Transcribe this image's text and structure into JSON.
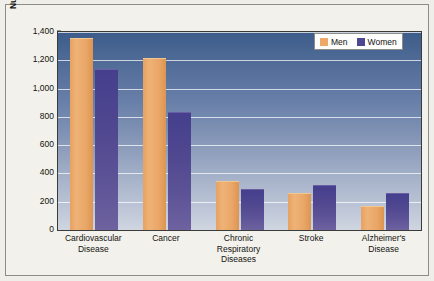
{
  "chart_data": {
    "type": "bar",
    "title": "",
    "xlabel": "",
    "ylabel": "Number of Deaths per 100,000 Annually",
    "ylim": [
      0,
      1400
    ],
    "yticks": [
      "0",
      "200",
      "400",
      "600",
      "800",
      "1,000",
      "1,200",
      "1,400"
    ],
    "ytick_values": [
      0,
      200,
      400,
      600,
      800,
      1000,
      1200,
      1400
    ],
    "grid": true,
    "legend_position": "top-right",
    "categories": [
      "Cardiovascular Disease",
      "Cancer",
      "Chronic Respiratory Diseases",
      "Stroke",
      "Alzheimer's Disease"
    ],
    "category_lines": [
      [
        "Cardiovascular",
        "Disease"
      ],
      [
        "Cancer"
      ],
      [
        "Chronic",
        "Respiratory",
        "Diseases"
      ],
      [
        "Stroke"
      ],
      [
        "Alzheimer's",
        "Disease"
      ]
    ],
    "series": [
      {
        "name": "Men",
        "color": "#e8a765",
        "values": [
          1350,
          1210,
          340,
          255,
          165
        ]
      },
      {
        "name": "Women",
        "color": "#4d4494",
        "values": [
          1130,
          830,
          280,
          310,
          255
        ]
      }
    ]
  },
  "legend": {
    "items": [
      {
        "label": "Men",
        "swatch": "men"
      },
      {
        "label": "Women",
        "swatch": "women"
      }
    ]
  },
  "colors": {
    "men": "#e8a765",
    "women": "#4d4494",
    "plot_top": "#3d5c8b",
    "plot_bottom": "#cfd5e0",
    "page_background": "#efeee8",
    "gridline": "#ffffff"
  }
}
